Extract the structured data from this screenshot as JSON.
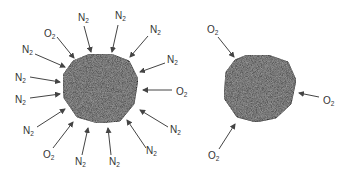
{
  "diagram": {
    "colors": {
      "particle_fill": "#5a5a5a",
      "arrow": "#444444",
      "text": "#333333"
    },
    "left_particle": {
      "labels": [
        {
          "base": "O",
          "sub": "2",
          "x": 44,
          "y": 33
        },
        {
          "base": "N",
          "sub": "2",
          "x": 78,
          "y": 17
        },
        {
          "base": "N",
          "sub": "2",
          "x": 116,
          "y": 15
        },
        {
          "base": "N",
          "sub": "2",
          "x": 149,
          "y": 29
        },
        {
          "base": "N",
          "sub": "2",
          "x": 168,
          "y": 59
        },
        {
          "base": "N",
          "sub": "2",
          "x": 23,
          "y": 49
        },
        {
          "base": "N",
          "sub": "2",
          "x": 16,
          "y": 78
        },
        {
          "base": "O",
          "sub": "2",
          "x": 177,
          "y": 92
        },
        {
          "base": "N",
          "sub": "2",
          "x": 16,
          "y": 103
        },
        {
          "base": "N",
          "sub": "2",
          "x": 173,
          "y": 129
        },
        {
          "base": "N",
          "sub": "2",
          "x": 24,
          "y": 134
        },
        {
          "base": "N",
          "sub": "2",
          "x": 148,
          "y": 150
        },
        {
          "base": "O",
          "sub": "2",
          "x": 44,
          "y": 155
        },
        {
          "base": "N",
          "sub": "2",
          "x": 78,
          "y": 165
        },
        {
          "base": "N",
          "sub": "2",
          "x": 110,
          "y": 165
        }
      ]
    },
    "right_particle": {
      "labels": [
        {
          "base": "O",
          "sub": "2",
          "x": 208,
          "y": 31
        },
        {
          "base": "O",
          "sub": "2",
          "x": 324,
          "y": 102
        },
        {
          "base": "O",
          "sub": "2",
          "x": 209,
          "y": 158
        }
      ]
    }
  }
}
